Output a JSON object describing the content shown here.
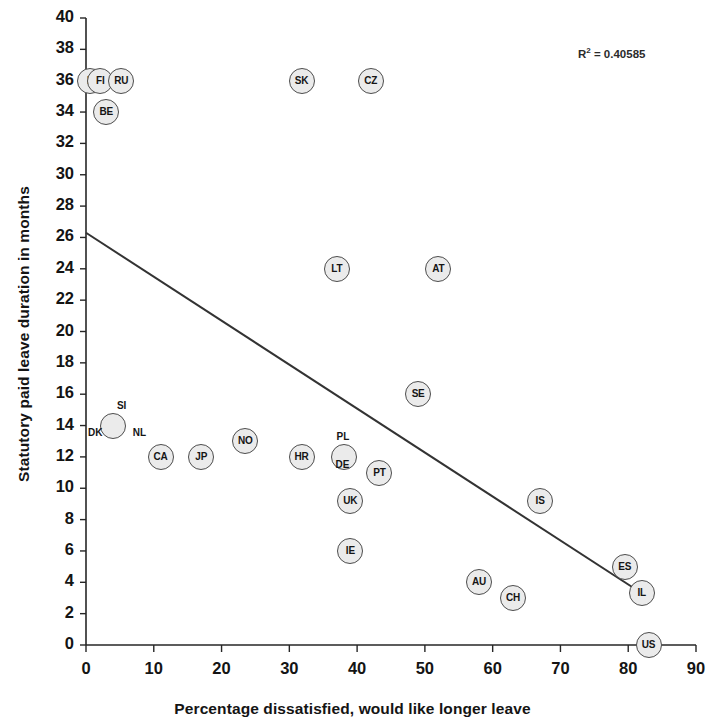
{
  "chart_data": {
    "type": "scatter",
    "title": "",
    "xlabel": "Percentage dissatisfied, would like longer leave",
    "ylabel": "Statutory paid leave duration in months",
    "xlim": [
      0,
      90
    ],
    "ylim": [
      0,
      40
    ],
    "xticks": [
      0,
      10,
      20,
      30,
      40,
      50,
      60,
      70,
      80,
      90
    ],
    "yticks": [
      0,
      2,
      4,
      6,
      8,
      10,
      12,
      14,
      16,
      18,
      20,
      22,
      24,
      26,
      28,
      30,
      32,
      34,
      36,
      38,
      40
    ],
    "grid": false,
    "legend": null,
    "annotations": [
      {
        "name": "r-squared",
        "prefix": "R",
        "sup": "2",
        "text": " = 0.40585",
        "full_text": "R² = 0.40585"
      }
    ],
    "trendline": {
      "type": "linear",
      "x_start": 0,
      "y_start": 26.3,
      "x_end": 82,
      "y_end": 3.3,
      "color": "#333333"
    },
    "points": [
      {
        "label": "F",
        "x": 0.6,
        "y": 36,
        "label_position": "inside"
      },
      {
        "label": "FI",
        "x": 2.1,
        "y": 36,
        "label_position": "inside"
      },
      {
        "label": "RU",
        "x": 5.2,
        "y": 36,
        "label_position": "inside"
      },
      {
        "label": "BE",
        "x": 3.0,
        "y": 34,
        "label_position": "inside"
      },
      {
        "label": "SK",
        "x": 31.8,
        "y": 36,
        "label_position": "inside"
      },
      {
        "label": "CZ",
        "x": 42.0,
        "y": 36,
        "label_position": "inside"
      },
      {
        "label": "LT",
        "x": 37.0,
        "y": 24,
        "label_position": "inside"
      },
      {
        "label": "AT",
        "x": 52.0,
        "y": 24,
        "label_position": "inside"
      },
      {
        "label": "SE",
        "x": 49.0,
        "y": 16,
        "label_position": "inside"
      },
      {
        "label": "SI",
        "x": 5.6,
        "y": 14,
        "label_position": "above"
      },
      {
        "label": "DK",
        "x": 4.0,
        "y": 14,
        "label_position": "left"
      },
      {
        "label": "NL",
        "x": 6.6,
        "y": 14,
        "label_position": "right"
      },
      {
        "label": "CA",
        "x": 11.0,
        "y": 12,
        "label_position": "inside"
      },
      {
        "label": "JP",
        "x": 17.0,
        "y": 12,
        "label_position": "inside"
      },
      {
        "label": "NO",
        "x": 23.5,
        "y": 13,
        "label_position": "inside"
      },
      {
        "label": "HR",
        "x": 31.8,
        "y": 12,
        "label_position": "inside"
      },
      {
        "label": "PL",
        "x": 38.0,
        "y": 12,
        "label_position": "above"
      },
      {
        "label": "DE",
        "x": 38.0,
        "y": 12,
        "label_position": "below"
      },
      {
        "label": "PT",
        "x": 43.3,
        "y": 11,
        "label_position": "inside"
      },
      {
        "label": "UK",
        "x": 39.0,
        "y": 9.2,
        "label_position": "inside"
      },
      {
        "label": "IE",
        "x": 39.0,
        "y": 6,
        "label_position": "inside"
      },
      {
        "label": "IS",
        "x": 67.0,
        "y": 9.2,
        "label_position": "inside"
      },
      {
        "label": "AU",
        "x": 58.0,
        "y": 4,
        "label_position": "inside"
      },
      {
        "label": "CH",
        "x": 63.0,
        "y": 3,
        "label_position": "inside"
      },
      {
        "label": "ES",
        "x": 79.5,
        "y": 5,
        "label_position": "inside"
      },
      {
        "label": "IL",
        "x": 82.0,
        "y": 3.3,
        "label_position": "inside"
      },
      {
        "label": "US",
        "x": 83.0,
        "y": 0,
        "label_position": "inside"
      }
    ]
  }
}
